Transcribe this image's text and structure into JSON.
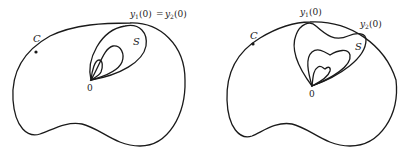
{
  "figures": [
    {
      "name": "left",
      "labels": {
        "curve": "C",
        "region": "S",
        "origin": "0",
        "point_var_1": "y",
        "point_sub_1": "1",
        "point_arg_1": "(0)",
        "relation": "=",
        "point_var_2": "y",
        "point_sub_2": "2",
        "point_arg_2": "(0)"
      },
      "inner_loops": 2
    },
    {
      "name": "right",
      "labels": {
        "curve": "C",
        "region": "S",
        "origin": "0",
        "point_var_1": "y",
        "point_sub_1": "1",
        "point_arg_1": "(0)",
        "point_var_2": "y",
        "point_sub_2": "2",
        "point_arg_2": "(0)"
      },
      "inner_loops": 2
    }
  ]
}
